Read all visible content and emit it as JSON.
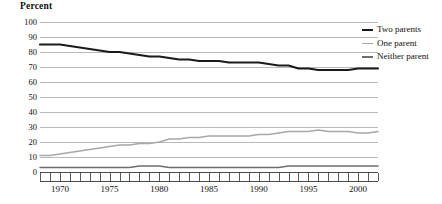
{
  "chart_data": {
    "type": "line",
    "title": "",
    "xlabel": "",
    "ylabel": "Percent",
    "ylim": [
      0,
      100
    ],
    "xlim": [
      1968,
      2002
    ],
    "ytick_labels": [
      "100",
      "90",
      "80",
      "70",
      "60",
      "50",
      "40",
      "30",
      "20",
      "10",
      "0"
    ],
    "ytick_values": [
      100,
      90,
      80,
      70,
      60,
      50,
      40,
      30,
      20,
      10,
      0
    ],
    "xtick_labels": [
      "1970",
      "1975",
      "1980",
      "1985",
      "1990",
      "1995",
      "2000"
    ],
    "xtick_values": [
      1970,
      1975,
      1980,
      1985,
      1990,
      1995,
      2000
    ],
    "grid": true,
    "legend_position": "right",
    "x": [
      1968,
      1969,
      1970,
      1971,
      1972,
      1973,
      1974,
      1975,
      1976,
      1977,
      1978,
      1979,
      1980,
      1981,
      1982,
      1983,
      1984,
      1985,
      1986,
      1987,
      1988,
      1989,
      1990,
      1991,
      1992,
      1993,
      1994,
      1995,
      1996,
      1997,
      1998,
      1999,
      2000,
      2001,
      2002
    ],
    "series": [
      {
        "name": "Two parents",
        "color": "#1a1a1a",
        "values": [
          85,
          85,
          85,
          84,
          83,
          82,
          81,
          80,
          80,
          79,
          78,
          77,
          77,
          76,
          75,
          75,
          74,
          74,
          74,
          73,
          73,
          73,
          73,
          72,
          71,
          71,
          69,
          69,
          68,
          68,
          68,
          68,
          69,
          69,
          69
        ]
      },
      {
        "name": "One parent",
        "color": "#a8a8a8",
        "values": [
          11,
          11,
          12,
          13,
          14,
          15,
          16,
          17,
          18,
          18,
          19,
          19,
          20,
          22,
          22,
          23,
          23,
          24,
          24,
          24,
          24,
          24,
          25,
          25,
          26,
          27,
          27,
          27,
          28,
          27,
          27,
          27,
          26,
          26,
          27
        ]
      },
      {
        "name": "Neither parent",
        "color": "#6e6e6e",
        "values": [
          3,
          3,
          3,
          3,
          3,
          3,
          3,
          3,
          3,
          3,
          4,
          4,
          4,
          3,
          3,
          3,
          3,
          3,
          3,
          3,
          3,
          3,
          3,
          3,
          3,
          4,
          4,
          4,
          4,
          4,
          4,
          4,
          4,
          4,
          4
        ]
      }
    ]
  },
  "legend": {
    "items": [
      {
        "label": "Two parents",
        "color": "#1a1a1a"
      },
      {
        "label": "One parent",
        "color": "#a8a8a8"
      },
      {
        "label": "Neither parent",
        "color": "#6e6e6e"
      }
    ]
  }
}
